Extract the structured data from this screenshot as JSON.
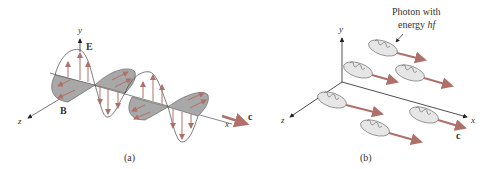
{
  "figure_a": {
    "caption": "(a)",
    "axis_y": "y",
    "axis_z": "z",
    "axis_x": "x",
    "label_E": "E",
    "label_B": "B",
    "label_c": "c"
  },
  "figure_b": {
    "caption": "(b)",
    "axis_y": "y",
    "axis_z": "z",
    "axis_x": "x",
    "label_c": "c",
    "photon_label_line1": "Photon with",
    "photon_label_line2_prefix": "energy ",
    "photon_label_hf": "hf"
  },
  "colors": {
    "arrow": "#b0706a",
    "magnetic_fill": "#a8a8a8",
    "axis": "#555555",
    "photon_fill": "#e6e6e6",
    "photon_stroke": "#777777"
  }
}
